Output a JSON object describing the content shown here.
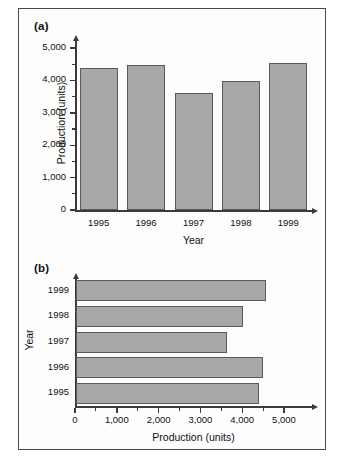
{
  "figure": {
    "panel_a_label": "(a)",
    "panel_b_label": "(b)"
  },
  "chart_data": [
    {
      "id": "panel-a",
      "type": "bar",
      "orientation": "vertical",
      "title": "",
      "categories": [
        "1995",
        "1996",
        "1997",
        "1998",
        "1999"
      ],
      "values": [
        4380,
        4480,
        3620,
        3990,
        4550
      ],
      "xlabel": "Year",
      "ylabel": "Production (units)",
      "ylim": [
        0,
        5000
      ],
      "ytick_labels": [
        "0",
        "1,000",
        "2,000",
        "3,000",
        "4,000",
        "5,000"
      ],
      "ytick_values": [
        0,
        1000,
        2000,
        3000,
        4000,
        5000
      ],
      "minor_tick_step": 500,
      "grid": false,
      "legend": "none",
      "bar_fill": "#a8a8a8",
      "bar_edge": "#5a5a5a"
    },
    {
      "id": "panel-b",
      "type": "bar",
      "orientation": "horizontal",
      "title": "",
      "categories": [
        "1995",
        "1996",
        "1997",
        "1998",
        "1999"
      ],
      "values": [
        4380,
        4480,
        3620,
        3990,
        4550
      ],
      "xlabel": "Production (units)",
      "ylabel": "Year",
      "xlim": [
        0,
        5000
      ],
      "xtick_labels": [
        "0",
        "1,000",
        "2,000",
        "3,000",
        "4,000",
        "5,000"
      ],
      "xtick_values": [
        0,
        1000,
        2000,
        3000,
        4000,
        5000
      ],
      "minor_tick_step": 500,
      "grid": false,
      "legend": "none",
      "bar_fill": "#a8a8a8",
      "bar_edge": "#5a5a5a"
    }
  ]
}
